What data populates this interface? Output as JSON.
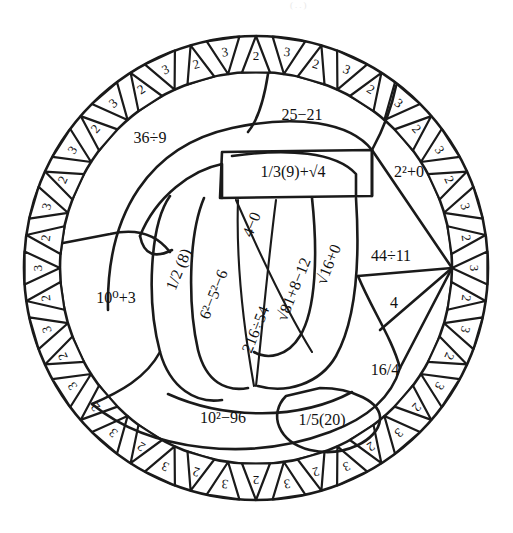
{
  "page": {
    "width": 513,
    "height": 533,
    "background_color": "#ffffff",
    "ink_color": "#1a1a1a",
    "faint_top_mark": "(..)"
  },
  "figure": {
    "type": "coloring-page",
    "shape": "pi-symbol-in-circle",
    "circle": {
      "center_x": 256,
      "center_y": 268,
      "outer_radius": 232,
      "inner_radius": 196
    }
  },
  "ring": {
    "name": "outer-triangle-ring",
    "triangle_count": 44,
    "alternating_values": [
      "2",
      "3"
    ],
    "labels": [
      "2",
      "3",
      "2",
      "3",
      "2",
      "3",
      "2",
      "3",
      "2",
      "3",
      "2",
      "3",
      "2",
      "3",
      "2",
      "3",
      "2",
      "3",
      "2",
      "3",
      "2",
      "3",
      "2",
      "3",
      "2",
      "3",
      "2",
      "3",
      "2",
      "3",
      "2",
      "3",
      "2",
      "3",
      "2",
      "3",
      "2",
      "3",
      "2",
      "3",
      "2",
      "3",
      "2",
      "3"
    ]
  },
  "regions": [
    {
      "id": "r-36div9",
      "label": "36÷9",
      "orientation": "horizontal",
      "x": 150,
      "y": 139
    },
    {
      "id": "r-25minus21",
      "label": "25−21",
      "orientation": "horizontal",
      "x": 302,
      "y": 116
    },
    {
      "id": "r-third9sqrt4",
      "label": "1/3(9)+√4",
      "orientation": "horizontal",
      "x": 293,
      "y": 173
    },
    {
      "id": "r-2sq0",
      "label": "2²+0",
      "orientation": "horizontal",
      "x": 409,
      "y": 173
    },
    {
      "id": "r-10pow0p3",
      "label": "10⁰+3",
      "orientation": "horizontal",
      "x": 116,
      "y": 299
    },
    {
      "id": "r-half8",
      "label": "1/2 (8)",
      "orientation": "vertical",
      "x": 180,
      "y": 270
    },
    {
      "id": "r-6sq5sq6",
      "label": "6²−5²−6",
      "orientation": "vertical",
      "x": 215,
      "y": 295
    },
    {
      "id": "r-4minus0",
      "label": "4−0",
      "orientation": "vertical",
      "x": 253,
      "y": 225
    },
    {
      "id": "r-216div54",
      "label": "216÷54",
      "orientation": "vertical",
      "x": 257,
      "y": 330
    },
    {
      "id": "r-sqrt81p8m12",
      "label": "√81+8−12",
      "orientation": "vertical",
      "x": 295,
      "y": 290
    },
    {
      "id": "r-sqrt16p0",
      "label": "√16+0",
      "orientation": "vertical",
      "x": 330,
      "y": 265
    },
    {
      "id": "r-44div11",
      "label": "44÷11",
      "orientation": "horizontal",
      "x": 391,
      "y": 257
    },
    {
      "id": "r-4",
      "label": "4",
      "orientation": "horizontal",
      "x": 394,
      "y": 304
    },
    {
      "id": "r-16over4",
      "label": "16/4",
      "orientation": "horizontal",
      "x": 385,
      "y": 371
    },
    {
      "id": "r-10sq96",
      "label": "10²−96",
      "orientation": "horizontal",
      "x": 223,
      "y": 419
    },
    {
      "id": "r-fifth20",
      "label": "1/5(20)",
      "orientation": "horizontal",
      "x": 322,
      "y": 421
    }
  ],
  "answers_note": "All expressions evaluate to 4.",
  "colors": {
    "ink": "#1a1a1a",
    "paper": "#ffffff"
  }
}
